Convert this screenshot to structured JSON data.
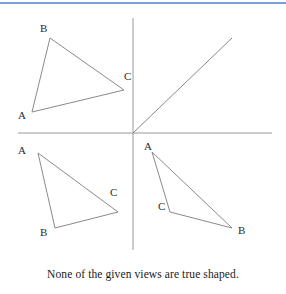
{
  "page": {
    "background_color": "#ffffff",
    "top_rule_color": "#7b9ed4",
    "line_color": "#8a8a8a",
    "axis_color": "#9a9a9a",
    "label_color": "#2b2b2b"
  },
  "caption": {
    "text": "None of the given views are true shaped."
  },
  "axes": {
    "origin": {
      "x": 133,
      "y": 133
    },
    "vertical": {
      "x1": 133,
      "y1": 18,
      "x2": 133,
      "y2": 250
    },
    "horizontal": {
      "x1": 18,
      "y1": 133,
      "x2": 272,
      "y2": 133
    }
  },
  "diagonal_line": {
    "name": "quadrant-one-line",
    "x1": 133,
    "y1": 133,
    "x2": 232,
    "y2": 38
  },
  "triangles": [
    {
      "name": "triangle-top-left",
      "quadrant": "second",
      "vertices": [
        {
          "label": "B",
          "x": 50,
          "y": 38,
          "label_x": 40,
          "label_y": 32
        },
        {
          "label": "C",
          "x": 124,
          "y": 90,
          "label_x": 124,
          "label_y": 80
        },
        {
          "label": "A",
          "x": 32,
          "y": 112,
          "label_x": 18,
          "label_y": 119
        }
      ]
    },
    {
      "name": "triangle-bottom-left",
      "quadrant": "third",
      "vertices": [
        {
          "label": "A",
          "x": 38,
          "y": 153,
          "label_x": 18,
          "label_y": 154
        },
        {
          "label": "C",
          "x": 118,
          "y": 212,
          "label_x": 110,
          "label_y": 196
        },
        {
          "label": "B",
          "x": 55,
          "y": 228,
          "label_x": 40,
          "label_y": 236
        }
      ]
    },
    {
      "name": "triangle-bottom-right",
      "quadrant": "fourth",
      "vertices": [
        {
          "label": "A",
          "x": 152,
          "y": 152,
          "label_x": 144,
          "label_y": 150
        },
        {
          "label": "C",
          "x": 170,
          "y": 212,
          "label_x": 158,
          "label_y": 210
        },
        {
          "label": "B",
          "x": 232,
          "y": 228,
          "label_x": 238,
          "label_y": 234
        }
      ]
    }
  ]
}
